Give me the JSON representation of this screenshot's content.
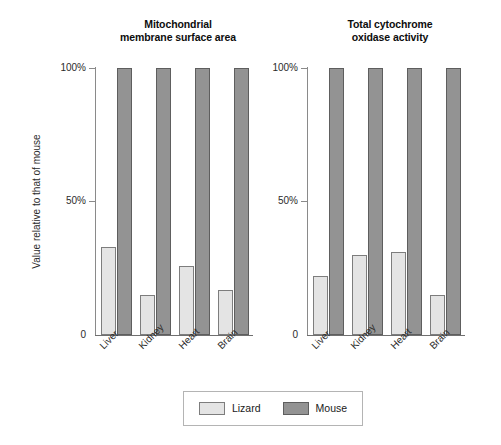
{
  "chart_data": [
    {
      "type": "bar",
      "title": "Mitochondrial membrane surface area",
      "title_lines": [
        "Mitochondrial",
        "membrane surface area"
      ],
      "categories": [
        "Liver",
        "Kidney",
        "Heart",
        "Brain"
      ],
      "series": [
        {
          "name": "Lizard",
          "values": [
            33,
            15,
            26,
            17
          ],
          "color": "#e4e4e4"
        },
        {
          "name": "Mouse",
          "values": [
            100,
            100,
            100,
            100
          ],
          "color": "#939393"
        }
      ],
      "xlabel": "",
      "ylabel": "Value relative to that of mouse",
      "ylim": [
        0,
        100
      ],
      "ytick_values": [
        0,
        50,
        100
      ],
      "ytick_labels": [
        "0",
        "50%",
        "100%"
      ],
      "grid": false,
      "legend_position": "bottom-center"
    },
    {
      "type": "bar",
      "title": "Total cytochrome oxidase activity",
      "title_lines": [
        "Total cytochrome",
        "oxidase activity"
      ],
      "categories": [
        "Liver",
        "Kidney",
        "Heart",
        "Brain"
      ],
      "series": [
        {
          "name": "Lizard",
          "values": [
            22,
            30,
            31,
            15
          ],
          "color": "#e4e4e4"
        },
        {
          "name": "Mouse",
          "values": [
            100,
            100,
            100,
            100
          ],
          "color": "#939393"
        }
      ],
      "xlabel": "",
      "ylabel": "Value relative to that of mouse",
      "ylim": [
        0,
        100
      ],
      "ytick_values": [
        0,
        50,
        100
      ],
      "ytick_labels": [
        "0",
        "50%",
        "100%"
      ],
      "grid": false,
      "legend_position": "bottom-center"
    }
  ],
  "axis": {
    "ylabel": "Value relative to that of mouse",
    "ytick_top": "100%",
    "ytick_mid": "50%",
    "ytick_bottom": "0"
  },
  "panels": {
    "left": {
      "title_line1": "Mitochondrial",
      "title_line2": "membrane surface area",
      "categories": [
        "Liver",
        "Kidney",
        "Heart",
        "Brain"
      ],
      "lizard": [
        33,
        15,
        26,
        17
      ],
      "mouse": [
        100,
        100,
        100,
        100
      ]
    },
    "right": {
      "title_line1": "Total cytochrome",
      "title_line2": "oxidase activity",
      "categories": [
        "Liver",
        "Kidney",
        "Heart",
        "Brain"
      ],
      "lizard": [
        22,
        30,
        31,
        15
      ],
      "mouse": [
        100,
        100,
        100,
        100
      ]
    }
  },
  "legend": {
    "items": [
      {
        "label": "Lizard",
        "color": "#e4e4e4"
      },
      {
        "label": "Mouse",
        "color": "#939393"
      }
    ]
  },
  "colors": {
    "lizard_fill": "#e4e4e4",
    "lizard_stroke": "#7d7d7d",
    "mouse_fill": "#939393",
    "mouse_stroke": "#5e5e5e",
    "axis": "#8a8a8a",
    "text": "#1a1a1a",
    "background": "#ffffff"
  }
}
